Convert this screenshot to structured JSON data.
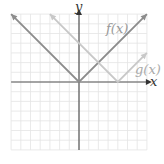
{
  "chart_data": {
    "type": "line",
    "title": "",
    "xlabel": "x",
    "ylabel": "y",
    "xlim": [
      -7,
      7
    ],
    "ylim": [
      -7,
      7
    ],
    "grid": true,
    "series": [
      {
        "name": "f(x)",
        "expr": "|x|",
        "color": "#8c8c8c",
        "x": [
          -7,
          0,
          7
        ],
        "y": [
          7,
          0,
          7
        ]
      },
      {
        "name": "g(x)",
        "expr": "|x-4|",
        "color": "#c8c8c8",
        "x": [
          -3,
          4,
          7
        ],
        "y": [
          7,
          0,
          3
        ]
      }
    ],
    "annotations": [
      {
        "text": "f(x)",
        "x": 4.2,
        "y": 5.8
      },
      {
        "text": "g(x)",
        "x": 5.6,
        "y": 1.4
      }
    ]
  },
  "labels": {
    "x_axis": "x",
    "y_axis": "y",
    "f": "f(x)",
    "g": "g(x)"
  }
}
